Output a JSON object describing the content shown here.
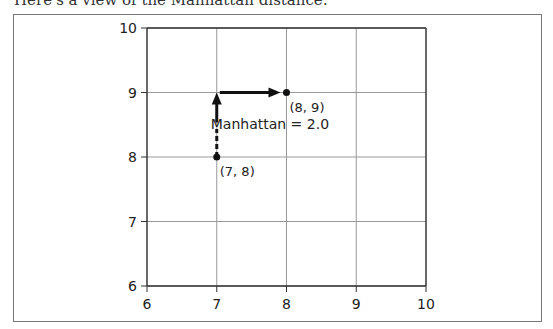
{
  "caption": "Here's a view of the Manhattan distance:",
  "chart_data": {
    "type": "scatter",
    "title": "",
    "xlabel": "",
    "ylabel": "",
    "xlim": [
      6,
      10
    ],
    "ylim": [
      6,
      10
    ],
    "grid": true,
    "x_ticks": [
      "6",
      "7",
      "8",
      "9",
      "10"
    ],
    "y_ticks": [
      "6",
      "7",
      "8",
      "9",
      "10"
    ],
    "points": [
      {
        "x": 7,
        "y": 8,
        "label": "(7, 8)"
      },
      {
        "x": 8,
        "y": 9,
        "label": "(8, 9)"
      }
    ],
    "paths": [
      {
        "from": [
          7,
          8
        ],
        "to": [
          7,
          9
        ],
        "style": "dashed-then-arrow",
        "direction": "up"
      },
      {
        "from": [
          7,
          9
        ],
        "to": [
          8,
          9
        ],
        "style": "arrow",
        "direction": "right"
      }
    ],
    "annotations": [
      {
        "text": "Manhattan = 2.0",
        "x": 7,
        "y": 8.5
      }
    ]
  }
}
